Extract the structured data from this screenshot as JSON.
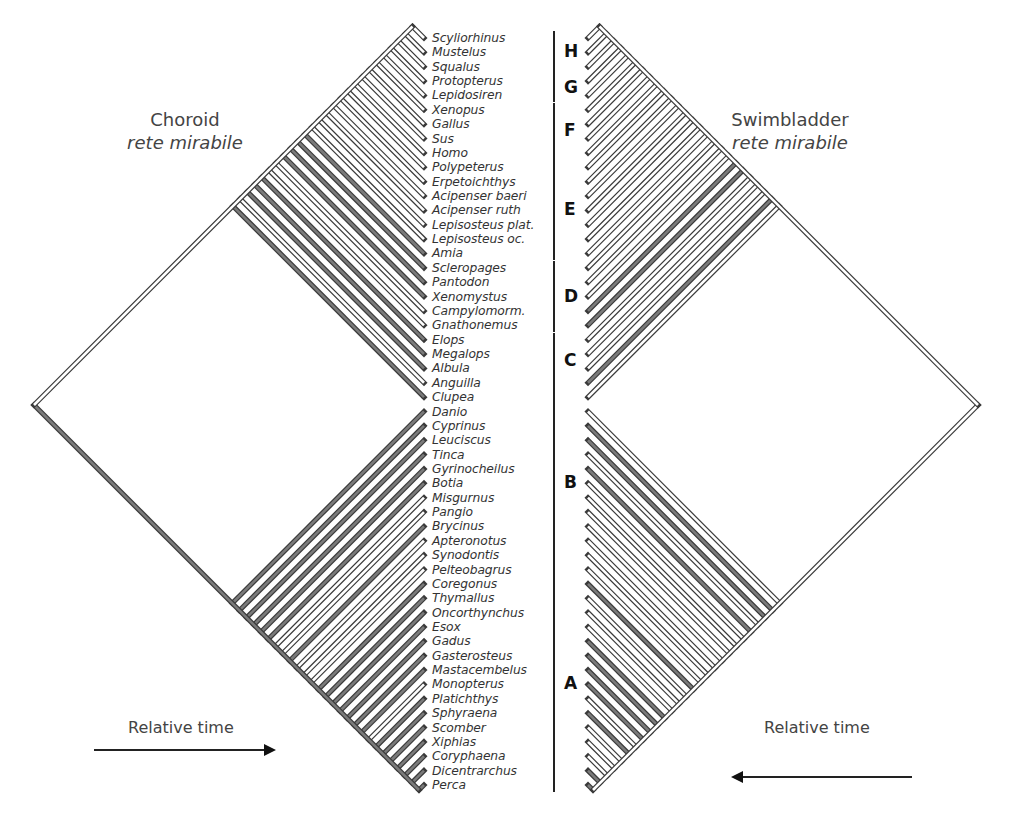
{
  "titles": {
    "left": {
      "main": "Choroid",
      "sub": "rete mirabile"
    },
    "right": {
      "main": "Swimbladder",
      "sub": "rete mirabile"
    }
  },
  "time_axis": {
    "left_label": "Relative time",
    "right_label": "Relative time"
  },
  "colors": {
    "line": "#3a3a3a",
    "present_fill": "#7a7a7a",
    "absent_fill": "#ffffff",
    "text": "#333333"
  },
  "taxa": [
    "Scyliorhinus",
    "Mustelus",
    "Squalus",
    "Protopterus",
    "Lepidosiren",
    "Xenopus",
    "Gallus",
    "Sus",
    "Homo",
    "Polypeterus",
    "Erpetoichthys",
    "Acipenser baeri",
    "Acipenser ruth",
    "Lepisosteus plat.",
    "Lepisosteus oc.",
    "Amia",
    "Scleropages",
    "Pantodon",
    "Xenomystus",
    "Campylomorm.",
    "Gnathonemus",
    "Elops",
    "Megalops",
    "Albula",
    "Anguilla",
    "Clupea",
    "Danio",
    "Cyprinus",
    "Leuciscus",
    "Tinca",
    "Gyrinocheilus",
    "Botia",
    "Misgurnus",
    "Pangio",
    "Brycinus",
    "Apteronotus",
    "Synodontis",
    "Pelteobagrus",
    "Coregonus",
    "Thymallus",
    "Oncorthynchus",
    "Esox",
    "Gadus",
    "Gasterosteus",
    "Mastacembelus",
    "Monopterus",
    "Platichthys",
    "Sphyraena",
    "Scomber",
    "Xiphias",
    "Coryphaena",
    "Dicentrarchus",
    "Perca"
  ],
  "groups": [
    {
      "label": "H",
      "start": 0,
      "end": 2
    },
    {
      "label": "G",
      "start": 3,
      "end": 4
    },
    {
      "label": "F",
      "start": 5,
      "end": 8
    },
    {
      "label": "E",
      "start": 9,
      "end": 15
    },
    {
      "label": "D",
      "start": 16,
      "end": 20
    },
    {
      "label": "C",
      "start": 21,
      "end": 24
    },
    {
      "label": "B",
      "start": 25,
      "end": 37
    },
    {
      "label": "A",
      "start": 38,
      "end": 52
    }
  ],
  "trait_present": {
    "choroid_rete": [
      "Amia",
      "Scleropages",
      "Pantodon",
      "Xenomystus",
      "Elops",
      "Megalops",
      "Albula",
      "Clupea",
      "Danio",
      "Cyprinus",
      "Leuciscus",
      "Tinca",
      "Gyrinocheilus",
      "Botia",
      "Brycinus",
      "Coregonus",
      "Thymallus",
      "Oncorthynchus",
      "Esox",
      "Gadus",
      "Gasterosteus",
      "Mastacembelus",
      "Platichthys",
      "Sphyraena",
      "Scomber",
      "Xiphias",
      "Coryphaena",
      "Dicentrarchus",
      "Perca"
    ],
    "swimbladder_rete": [
      "Campylomorm.",
      "Gnathonemus",
      "Anguilla",
      "Cyprinus",
      "Leuciscus",
      "Gyrinocheilus",
      "Coregonus",
      "Gadus",
      "Gasterosteus",
      "Mastacembelus",
      "Monopterus",
      "Sphyraena",
      "Dicentrarchus",
      "Perca"
    ]
  },
  "chart_data": {
    "type": "cladogram",
    "title_left": "Choroid rete mirabile",
    "title_right": "Swimbladder rete mirabile",
    "xlabel": "Relative time",
    "taxa_count": 53,
    "groups": [
      "H",
      "G",
      "F",
      "E",
      "D",
      "C",
      "B",
      "A"
    ],
    "legend": {
      "grey_branch": "trait present",
      "white_branch": "trait absent"
    }
  }
}
